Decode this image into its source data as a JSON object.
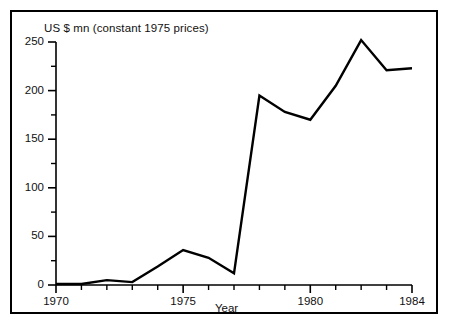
{
  "chart_data": {
    "type": "line",
    "title": "US $ mn (constant 1975 prices)",
    "xlabel": "Year",
    "ylabel": "",
    "x": [
      1970,
      1971,
      1972,
      1973,
      1974,
      1975,
      1976,
      1977,
      1978,
      1979,
      1980,
      1981,
      1982,
      1983,
      1984
    ],
    "values": [
      1,
      1,
      5,
      3,
      19,
      36,
      28,
      12,
      195,
      178,
      170,
      205,
      252,
      221,
      223
    ],
    "series": [
      {
        "name": "US $ mn (constant 1975 prices)",
        "values": [
          1,
          1,
          5,
          3,
          19,
          36,
          28,
          12,
          195,
          178,
          170,
          205,
          252,
          221,
          223
        ]
      }
    ],
    "xlim": [
      1970,
      1984
    ],
    "ylim": [
      0,
      250
    ],
    "x_major_ticks": [
      1970,
      1975,
      1980,
      1984
    ],
    "x_major_tick_labels": [
      "1970",
      "1975",
      "1980",
      "1984"
    ],
    "x_minor_ticks": [
      1971,
      1972,
      1973,
      1974,
      1976,
      1977,
      1978,
      1979,
      1981,
      1982,
      1983
    ],
    "y_major_ticks": [
      0,
      50,
      100,
      150,
      200,
      250
    ],
    "y_major_tick_labels": [
      "0",
      "50",
      "100",
      "150",
      "200",
      "250"
    ],
    "y_minor_ticks": [
      25,
      75,
      125,
      175,
      225
    ],
    "grid": false,
    "legend": false,
    "line_color": "#000000",
    "line_width": 2.4,
    "background_color": "#ffffff",
    "frame_color": "#000000"
  }
}
